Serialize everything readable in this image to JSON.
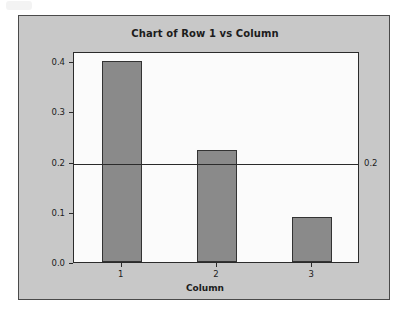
{
  "chart_data": {
    "type": "bar",
    "title": "Chart of Row 1 vs Column",
    "categories": [
      "1",
      "2",
      "3"
    ],
    "values": [
      0.4,
      0.222,
      0.09
    ],
    "xlabel": "Column",
    "ylabel": "Row 1 proportion",
    "ylim": [
      0.0,
      0.42
    ],
    "yticks": [
      "0.0",
      "0.1",
      "0.2",
      "0.3",
      "0.4"
    ],
    "ytick_values": [
      0.0,
      0.1,
      0.2,
      0.3,
      0.4
    ],
    "grid": false,
    "legend": "none",
    "reference_line": {
      "value": 0.2,
      "label": "0.2",
      "position": "right-outside"
    },
    "colors": {
      "bar_fill": "#8a8a8a",
      "bar_edge": "#333333",
      "panel_background": "#c8c8c8",
      "plot_background": "#fbfbfb",
      "axis": "#2b2b2b",
      "text": "#1c1c1c"
    }
  }
}
